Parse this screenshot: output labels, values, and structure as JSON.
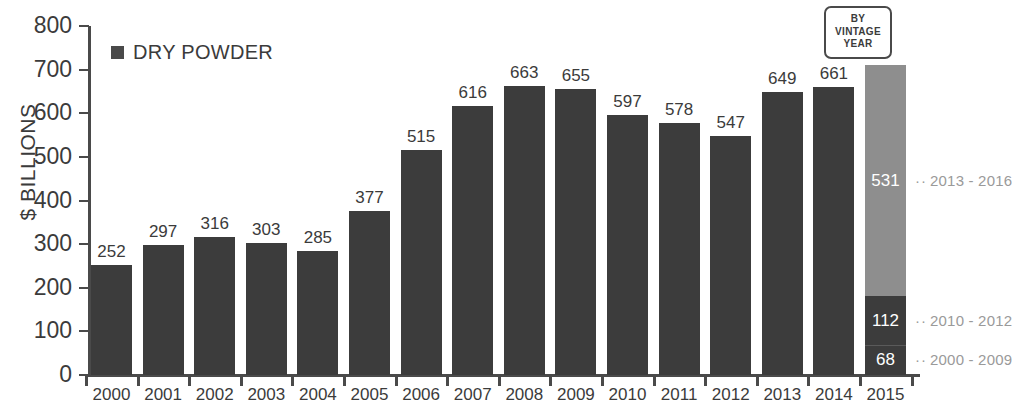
{
  "chart_data": {
    "type": "bar",
    "title": "",
    "xlabel": "",
    "ylabel": "$ BILLIONS",
    "ylim": [
      0,
      800
    ],
    "ytick_values": [
      0,
      100,
      200,
      300,
      400,
      500,
      600,
      700,
      800
    ],
    "ytick_labels": [
      "0",
      "100",
      "200",
      "300",
      "400",
      "500",
      "600",
      "700",
      "800"
    ],
    "grid": false,
    "legend": {
      "position": "top-left",
      "entries": [
        {
          "label": "DRY POWDER",
          "color": "#3c3c3c",
          "marker": "square"
        }
      ]
    },
    "categories": [
      "2000",
      "2001",
      "2002",
      "2003",
      "2004",
      "2005",
      "2006",
      "2007",
      "2008",
      "2009",
      "2010",
      "2011",
      "2012",
      "2013",
      "2014",
      "2015"
    ],
    "values": [
      252,
      297,
      316,
      303,
      285,
      377,
      515,
      616,
      663,
      655,
      597,
      578,
      547,
      649,
      661,
      711
    ],
    "series": [
      {
        "name": "DRY POWDER",
        "values": [
          252,
          297,
          316,
          303,
          285,
          377,
          515,
          616,
          663,
          655,
          597,
          578,
          547,
          649,
          661,
          null
        ]
      }
    ],
    "stacked_column": {
      "category": "2015",
      "total": 711,
      "segments": [
        {
          "value": 531,
          "label": "531",
          "annotation": "2013 - 2016",
          "color": "#8e8e8e"
        },
        {
          "value": 112,
          "label": "112",
          "annotation": "2010 - 2012",
          "color": "#3c3c3c"
        },
        {
          "value": 68,
          "label": "68",
          "annotation": "2000 - 2009",
          "color": "#3c3c3c"
        }
      ]
    },
    "annotations": [
      {
        "name": "by-vintage-year-badge",
        "lines": [
          "BY",
          "VINTAGE",
          "YEAR"
        ]
      }
    ],
    "colors": {
      "bar_dark": "#3c3c3c",
      "bar_light": "#8e8e8e",
      "axis": "#4a4a4a",
      "text": "#3b3b3b",
      "annotation_text": "#9a9a9a",
      "segment_label": "#ffffff"
    }
  }
}
